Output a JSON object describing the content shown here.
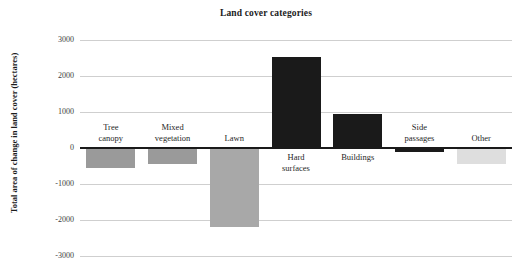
{
  "chart_data": {
    "type": "bar",
    "title": "Land cover categories",
    "xlabel": "",
    "ylabel": "Total area of change in land cover (hectares)",
    "categories": [
      "Tree canopy",
      "Mixed vegetation",
      "Lawn",
      "Hard surfaces",
      "Buildings",
      "Side passages",
      "Other"
    ],
    "values": [
      -550,
      -440,
      -2200,
      2530,
      950,
      -110,
      -450
    ],
    "ylim": [
      -3000,
      3000
    ],
    "yticks": [
      3000,
      2000,
      1000,
      0,
      -1000,
      -2000,
      -3000
    ],
    "ytick_labels": [
      "3000",
      "2000",
      "1000",
      "0",
      "-1000",
      "-2000",
      "-3000"
    ],
    "grid": true,
    "legend": false,
    "bar_colors": [
      "#9a9a9a",
      "#9a9a9a",
      "#a8a8a8",
      "#1a1a1a",
      "#1a1a1a",
      "#1a1a1a",
      "#dedede"
    ],
    "zero_line_color": "#1a1a1a",
    "grid_color": "#cfcfcf"
  },
  "axis": {
    "tick_0": "3000",
    "tick_1": "2000",
    "tick_2": "1000",
    "tick_3": "0",
    "tick_4": "-1000",
    "tick_5": "-2000",
    "tick_6": "-3000"
  },
  "labels": {
    "cat_0_line1": "Tree",
    "cat_0_line2": "canopy",
    "cat_1_line1": "Mixed",
    "cat_1_line2": "vegetation",
    "cat_2_line1": "Lawn",
    "cat_2_line2": "",
    "cat_3_line1": "Hard",
    "cat_3_line2": "surfaces",
    "cat_4_line1": "Buildings",
    "cat_4_line2": "",
    "cat_5_line1": "Side",
    "cat_5_line2": "passages",
    "cat_6_line1": "Other",
    "cat_6_line2": ""
  }
}
